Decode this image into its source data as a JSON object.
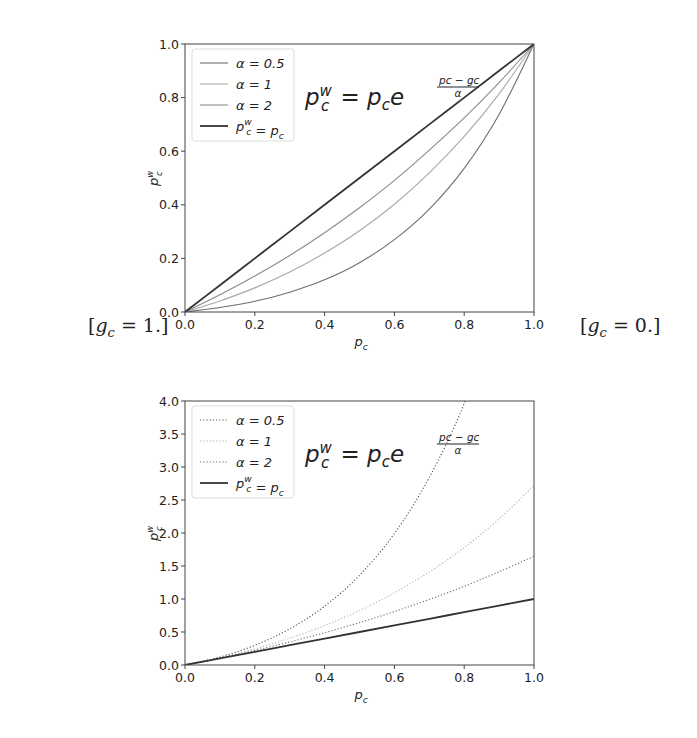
{
  "side_labels": {
    "left": "[g_c = 1.]",
    "right": "[g_c = 0.]"
  },
  "chart_data": [
    {
      "type": "line",
      "title": "",
      "formula": "p_c^w = p_c e^((p_c - g_c)/α)",
      "condition": "g_c = 1.",
      "xlabel": "p_c",
      "ylabel": "p_c^w",
      "xlim": [
        0.0,
        1.0
      ],
      "ylim": [
        0.0,
        1.0
      ],
      "xticks": [
        "0.0",
        "0.2",
        "0.4",
        "0.6",
        "0.8",
        "1.0"
      ],
      "yticks": [
        "0.0",
        "0.2",
        "0.4",
        "0.6",
        "0.8",
        "1.0"
      ],
      "grid": false,
      "legend_position": "upper left",
      "line_style": "solid",
      "x": [
        0.0,
        0.1,
        0.2,
        0.3,
        0.4,
        0.5,
        0.6,
        0.7,
        0.8,
        0.9,
        1.0
      ],
      "series": [
        {
          "name": "α = 0.5",
          "color": "#6e6e6e",
          "values": [
            0.0,
            0.017,
            0.04,
            0.074,
            0.12,
            0.184,
            0.27,
            0.384,
            0.536,
            0.737,
            1.0
          ]
        },
        {
          "name": "α = 1",
          "color": "#a8a8a8",
          "values": [
            0.0,
            0.041,
            0.09,
            0.149,
            0.22,
            0.303,
            0.402,
            0.519,
            0.655,
            0.814,
            1.0
          ]
        },
        {
          "name": "α = 2",
          "color": "#8a8a8a",
          "values": [
            0.0,
            0.064,
            0.134,
            0.211,
            0.296,
            0.389,
            0.491,
            0.604,
            0.724,
            0.856,
            1.0
          ]
        },
        {
          "name": "p_c^w = p_c",
          "color": "#333333",
          "values": [
            0.0,
            0.1,
            0.2,
            0.3,
            0.4,
            0.5,
            0.6,
            0.7,
            0.8,
            0.9,
            1.0
          ]
        }
      ]
    },
    {
      "type": "line",
      "title": "",
      "formula": "p_c^w = p_c e^((p_c - g_c)/α)",
      "condition": "g_c = 0.",
      "xlabel": "p_c",
      "ylabel": "p_c^w",
      "xlim": [
        0.0,
        1.0
      ],
      "ylim": [
        0.0,
        4.0
      ],
      "xticks": [
        "0.0",
        "0.2",
        "0.4",
        "0.6",
        "0.8",
        "1.0"
      ],
      "yticks": [
        "0.0",
        "0.5",
        "1.0",
        "1.5",
        "2.0",
        "2.5",
        "3.0",
        "3.5",
        "4.0"
      ],
      "grid": false,
      "legend_position": "upper left",
      "line_style": "dotted (identity line solid)",
      "x": [
        0.0,
        0.1,
        0.2,
        0.3,
        0.4,
        0.5,
        0.6,
        0.7,
        0.8,
        0.9,
        1.0
      ],
      "series": [
        {
          "name": "α = 0.5",
          "color": "#555555",
          "values": [
            0.0,
            0.122,
            0.298,
            0.547,
            0.89,
            1.359,
            1.992,
            2.842,
            3.962,
            5.444,
            7.389
          ]
        },
        {
          "name": "α = 1",
          "color": "#b0b0b0",
          "values": [
            0.0,
            0.111,
            0.244,
            0.405,
            0.597,
            0.824,
            1.093,
            1.41,
            1.78,
            2.214,
            2.718
          ]
        },
        {
          "name": "α = 2",
          "color": "#707070",
          "values": [
            0.0,
            0.105,
            0.221,
            0.349,
            0.489,
            0.642,
            0.81,
            0.993,
            1.192,
            1.412,
            1.649
          ]
        },
        {
          "name": "p_c^w = p_c",
          "color": "#333333",
          "values": [
            0.0,
            0.1,
            0.2,
            0.3,
            0.4,
            0.5,
            0.6,
            0.7,
            0.8,
            0.9,
            1.0
          ]
        }
      ]
    }
  ]
}
